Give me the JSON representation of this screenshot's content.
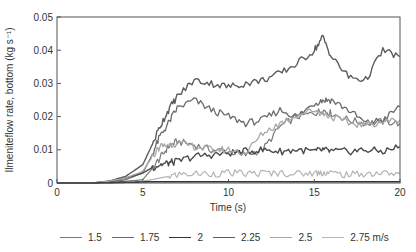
{
  "chart_data": {
    "type": "line",
    "title": "",
    "xlabel": "Time (s)",
    "ylabel": "Ilmeniteflow rate, bottom (kg s⁻¹)",
    "xlim": [
      0,
      20
    ],
    "ylim": [
      0,
      0.05
    ],
    "xticks": [
      0,
      5,
      10,
      15,
      20
    ],
    "yticks": [
      0,
      0.01,
      0.02,
      0.03,
      0.04,
      0.05
    ],
    "xtick_labels": [
      "0",
      "5",
      "10",
      "15",
      "20"
    ],
    "ytick_labels": [
      "0",
      "0.01",
      "0.02",
      "0.03",
      "0.04",
      "0.05"
    ],
    "grid": false,
    "legend_position": "bottom",
    "legend_unit": "m/s",
    "x": [
      0,
      2,
      3,
      4,
      5,
      5.5,
      6,
      6.5,
      7,
      8,
      9,
      10,
      11,
      12,
      13,
      14,
      15,
      15.5,
      16,
      17,
      18,
      19,
      20
    ],
    "series": [
      {
        "name": "1.5",
        "color": "#7a7a7a",
        "width": 1.2,
        "values": [
          0,
          0,
          0.0002,
          0.0005,
          0.001,
          0.004,
          0.0075,
          0.011,
          0.0125,
          0.0115,
          0.01,
          0.0095,
          0.0085,
          0.01,
          0.017,
          0.02,
          0.021,
          0.022,
          0.021,
          0.019,
          0.018,
          0.0185,
          0.018
        ]
      },
      {
        "name": "1.75",
        "color": "#6a6a6a",
        "width": 1.3,
        "values": [
          0,
          0,
          0.0003,
          0.001,
          0.003,
          0.008,
          0.014,
          0.018,
          0.0225,
          0.025,
          0.022,
          0.02,
          0.018,
          0.019,
          0.022,
          0.02,
          0.024,
          0.025,
          0.025,
          0.022,
          0.018,
          0.019,
          0.023
        ]
      },
      {
        "name": "2",
        "color": "#4a4a4a",
        "width": 1.4,
        "values": [
          0,
          0,
          0.0005,
          0.0015,
          0.003,
          0.0045,
          0.0055,
          0.006,
          0.0065,
          0.008,
          0.0085,
          0.009,
          0.0095,
          0.01,
          0.0095,
          0.01,
          0.0095,
          0.01,
          0.0095,
          0.0095,
          0.01,
          0.0095,
          0.011
        ]
      },
      {
        "name": "2.25",
        "color": "#5c5c5c",
        "width": 1.4,
        "values": [
          0,
          0,
          0.0005,
          0.002,
          0.0055,
          0.011,
          0.017,
          0.022,
          0.026,
          0.031,
          0.03,
          0.029,
          0.03,
          0.031,
          0.033,
          0.036,
          0.04,
          0.044,
          0.038,
          0.032,
          0.031,
          0.04,
          0.038
        ]
      },
      {
        "name": "2.5",
        "color": "#a8a8a8",
        "width": 1.3,
        "values": [
          0,
          0,
          0.0005,
          0.0015,
          0.0035,
          0.0075,
          0.011,
          0.0115,
          0.012,
          0.011,
          0.01,
          0.01,
          0.009,
          0.015,
          0.018,
          0.0205,
          0.022,
          0.021,
          0.02,
          0.018,
          0.0175,
          0.0185,
          0.019
        ]
      },
      {
        "name": "2.75 m/s",
        "color": "#b5b5b5",
        "width": 1.2,
        "values": [
          0,
          0,
          0,
          0.0002,
          0.0005,
          0.001,
          0.0015,
          0.002,
          0.0025,
          0.0028,
          0.0028,
          0.003,
          0.0028,
          0.003,
          0.003,
          0.0028,
          0.003,
          0.0032,
          0.003,
          0.0025,
          0.0028,
          0.003,
          0.0028
        ]
      },
      {
        "name": "baseline",
        "color": "#333333",
        "width": 1.6,
        "values": [
          0,
          0,
          0.0001,
          0.0002,
          0.0003,
          0.0004,
          0.0004,
          0.0004,
          0.0004,
          0.0004,
          0.0004,
          0.0004,
          0.0004,
          0.0004,
          0.0004,
          0.0004,
          0.0004,
          0.0004,
          0.0004,
          0.0004,
          0.0004,
          0.0004,
          0.0004
        ]
      }
    ]
  },
  "legend": {
    "items": [
      {
        "label": "1.5",
        "color": "#7a7a7a"
      },
      {
        "label": "1.75",
        "color": "#6a6a6a"
      },
      {
        "label": "2",
        "color": "#333333"
      },
      {
        "label": "2.25",
        "color": "#5c5c5c"
      },
      {
        "label": "2.5",
        "color": "#a8a8a8"
      },
      {
        "label": "2.75 m/s",
        "color": "#b5b5b5"
      }
    ]
  },
  "axes": {
    "xlabel": "Time (s)",
    "ylabel": "Ilmeniteflow rate, bottom (kg s⁻¹)"
  }
}
